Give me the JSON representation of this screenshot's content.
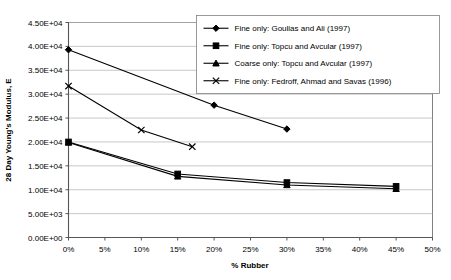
{
  "chart_data": {
    "type": "line",
    "title": "",
    "xlabel": "% Rubber",
    "ylabel": "28 Day Young's Modulus, E",
    "xlim": [
      0,
      50
    ],
    "ylim": [
      0,
      45000
    ],
    "grid": "horizontal",
    "legend_position": "top-right",
    "x_tick_labels": [
      "0%",
      "5%",
      "10%",
      "15%",
      "20%",
      "25%",
      "30%",
      "35%",
      "40%",
      "45%",
      "50%"
    ],
    "x_tick_values": [
      0,
      5,
      10,
      15,
      20,
      25,
      30,
      35,
      40,
      45,
      50
    ],
    "y_tick_labels": [
      "0.00E+00",
      "5.00E+03",
      "1.00E+04",
      "1.50E+04",
      "2.00E+04",
      "2.50E+04",
      "3.00E+04",
      "3.50E+04",
      "4.00E+04",
      "4.50E+04"
    ],
    "y_tick_values": [
      0,
      5000,
      10000,
      15000,
      20000,
      25000,
      30000,
      35000,
      40000,
      45000
    ],
    "series": [
      {
        "name": "Fine only: Goulias and Ali (1997)",
        "marker": "diamond",
        "x": [
          0,
          20,
          30
        ],
        "values": [
          39300,
          27700,
          22700
        ]
      },
      {
        "name": "Fine only: Topcu and Avcular (1997)",
        "marker": "square",
        "x": [
          0,
          15,
          30,
          45
        ],
        "values": [
          20000,
          13300,
          11500,
          10700
        ]
      },
      {
        "name": "Coarse only: Topcu and Avcular (1997)",
        "marker": "triangle",
        "x": [
          0,
          15,
          30,
          45
        ],
        "values": [
          19900,
          12800,
          11000,
          10200
        ]
      },
      {
        "name": "Fine only: Fedroff, Ahmad and Savas (1996)",
        "marker": "cross",
        "x": [
          0,
          10,
          17
        ],
        "values": [
          31700,
          22500,
          19000
        ]
      }
    ]
  },
  "colors": {
    "series": "#000000",
    "gridline": "#b0b0b0",
    "axis": "#555555",
    "frame": "#808080",
    "background": "#ffffff"
  }
}
